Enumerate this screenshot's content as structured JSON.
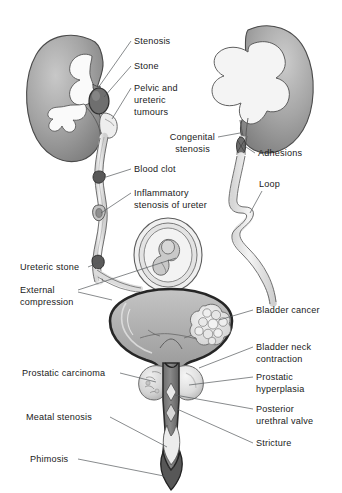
{
  "figure": {
    "background_color": "#ffffff",
    "ink_color": "#1a1a1a",
    "leader_color": "#55595c"
  },
  "palette": {
    "kidney_cortex_dark": "#8d8d8d",
    "kidney_cortex_mid": "#a9a9a9",
    "kidney_cortex_light": "#cfcfcf",
    "calyx_fill": "#fafafa",
    "pelvis_fill": "#f2f2f2",
    "ureter_fill": "#ededed",
    "bladder_fill": "#b0b0b0",
    "bladder_outline": "#262626",
    "stone_fill": "#6f6f6f",
    "tumour_fill": "#e8e8e8",
    "prostate_fill": "#dcdcdc",
    "urethra_dark": "#5a5a5a",
    "fetus_fill": "#d8d8d8",
    "outline": "#4a4a4a"
  },
  "labels": [
    {
      "id": "stenosis",
      "name": "label-stenosis",
      "text": "Stenosis",
      "x": 134,
      "y": 44,
      "anchor": "start"
    },
    {
      "id": "stone",
      "name": "label-stone",
      "text": "Stone",
      "x": 134,
      "y": 69,
      "anchor": "start"
    },
    {
      "id": "pelvic-ureteric-tumours-1",
      "name": "label-pelvic-ureteric-tumours-line1",
      "text": "Pelvic and",
      "x": 134,
      "y": 91,
      "anchor": "start"
    },
    {
      "id": "pelvic-ureteric-tumours-2",
      "name": "label-pelvic-ureteric-tumours-line2",
      "text": "ureteric",
      "x": 134,
      "y": 103,
      "anchor": "start"
    },
    {
      "id": "pelvic-ureteric-tumours-3",
      "name": "label-pelvic-ureteric-tumours-line3",
      "text": "tumours",
      "x": 134,
      "y": 115,
      "anchor": "start"
    },
    {
      "id": "congenital-stenosis-1",
      "name": "label-congenital-stenosis-line1",
      "text": "Congenital",
      "x": 215,
      "y": 140,
      "anchor": "end"
    },
    {
      "id": "congenital-stenosis-2",
      "name": "label-congenital-stenosis-line2",
      "text": "stenosis",
      "x": 210,
      "y": 152,
      "anchor": "end"
    },
    {
      "id": "adhesions",
      "name": "label-adhesions",
      "text": "Adhesions",
      "x": 258,
      "y": 156,
      "anchor": "start"
    },
    {
      "id": "blood-clot",
      "name": "label-blood-clot",
      "text": "Blood clot",
      "x": 134,
      "y": 172,
      "anchor": "start"
    },
    {
      "id": "loop",
      "name": "label-loop",
      "text": "Loop",
      "x": 259,
      "y": 187,
      "anchor": "start"
    },
    {
      "id": "inflammatory-stenosis-1",
      "name": "label-inflammatory-stenosis-line1",
      "text": "Inflammatory",
      "x": 134,
      "y": 196,
      "anchor": "start"
    },
    {
      "id": "inflammatory-stenosis-2",
      "name": "label-inflammatory-stenosis-line2",
      "text": "stenosis of ureter",
      "x": 134,
      "y": 208,
      "anchor": "start"
    },
    {
      "id": "ureteric-stone",
      "name": "label-ureteric-stone",
      "text": "Ureteric stone",
      "x": 20,
      "y": 270,
      "anchor": "start"
    },
    {
      "id": "external-compression-1",
      "name": "label-external-compression-line1",
      "text": "External",
      "x": 20,
      "y": 293,
      "anchor": "start"
    },
    {
      "id": "external-compression-2",
      "name": "label-external-compression-line2",
      "text": "compression",
      "x": 20,
      "y": 305,
      "anchor": "start"
    },
    {
      "id": "bladder-cancer",
      "name": "label-bladder-cancer",
      "text": "Bladder cancer",
      "x": 256,
      "y": 313,
      "anchor": "start"
    },
    {
      "id": "bladder-neck-1",
      "name": "label-bladder-neck-contraction-line1",
      "text": "Bladder neck",
      "x": 256,
      "y": 350,
      "anchor": "start"
    },
    {
      "id": "bladder-neck-2",
      "name": "label-bladder-neck-contraction-line2",
      "text": "contraction",
      "x": 256,
      "y": 362,
      "anchor": "start"
    },
    {
      "id": "prostatic-carcinoma",
      "name": "label-prostatic-carcinoma",
      "text": "Prostatic carcinoma",
      "x": 22,
      "y": 376,
      "anchor": "start"
    },
    {
      "id": "prostatic-hyperplasia-1",
      "name": "label-prostatic-hyperplasia-line1",
      "text": "Prostatic",
      "x": 256,
      "y": 380,
      "anchor": "start"
    },
    {
      "id": "prostatic-hyperplasia-2",
      "name": "label-prostatic-hyperplasia-line2",
      "text": "hyperplasia",
      "x": 256,
      "y": 392,
      "anchor": "start"
    },
    {
      "id": "posterior-urethral-valve-1",
      "name": "label-posterior-urethral-valve-line1",
      "text": "Posterior",
      "x": 256,
      "y": 412,
      "anchor": "start"
    },
    {
      "id": "posterior-urethral-valve-2",
      "name": "label-posterior-urethral-valve-line2",
      "text": "urethral valve",
      "x": 256,
      "y": 424,
      "anchor": "start"
    },
    {
      "id": "meatal-stenosis",
      "name": "label-meatal-stenosis",
      "text": "Meatal stenosis",
      "x": 26,
      "y": 420,
      "anchor": "start"
    },
    {
      "id": "stricture",
      "name": "label-stricture",
      "text": "Stricture",
      "x": 256,
      "y": 446,
      "anchor": "start"
    },
    {
      "id": "phimosis",
      "name": "label-phimosis",
      "text": "Phimosis",
      "x": 30,
      "y": 462,
      "anchor": "start"
    }
  ],
  "leaders": [
    {
      "name": "leader-stenosis",
      "d": "M131,41 L98,88"
    },
    {
      "name": "leader-stone",
      "d": "M131,66 L104,97"
    },
    {
      "name": "leader-pelvic-tumours",
      "d": "M131,88 L112,119"
    },
    {
      "name": "leader-congenital-stenosis",
      "d": "M218,137 L240,133"
    },
    {
      "name": "leader-adhesions",
      "d": "M255,153 L243,145"
    },
    {
      "name": "leader-blood-clot",
      "d": "M131,169 L106,177"
    },
    {
      "name": "leader-loop",
      "d": "M262,191 L250,213"
    },
    {
      "name": "leader-inflammatory-stenosis",
      "d": "M131,193 L101,213"
    },
    {
      "name": "leader-ureteric-stone",
      "d": "M88,267 L100,262"
    },
    {
      "name": "leader-external-compression-a",
      "d": "M78,290 L176,258"
    },
    {
      "name": "leader-external-compression-b",
      "d": "M78,292 L112,300"
    },
    {
      "name": "leader-bladder-cancer",
      "d": "M253,310 L219,320"
    },
    {
      "name": "leader-bladder-neck",
      "d": "M253,347 L199,368"
    },
    {
      "name": "leader-prostatic-carcinoma",
      "d": "M120,373 L156,382"
    },
    {
      "name": "leader-prostatic-hyperplasia",
      "d": "M253,377 L189,385"
    },
    {
      "name": "leader-posterior-urethral-valve",
      "d": "M253,409 L175,395"
    },
    {
      "name": "leader-meatal-stenosis",
      "d": "M110,417 L167,447"
    },
    {
      "name": "leader-stricture",
      "d": "M253,443 L177,409"
    },
    {
      "name": "leader-phimosis",
      "d": "M78,459 L169,477"
    }
  ],
  "structures": [
    {
      "name": "left-kidney",
      "description": "Left kidney with dilated calyces"
    },
    {
      "name": "right-kidney",
      "description": "Right kidney with hydronephrosis"
    },
    {
      "name": "left-ureter",
      "description": "Left ureter"
    },
    {
      "name": "right-ureter",
      "description": "Right ureter with loop"
    },
    {
      "name": "gravid-uterus",
      "description": "Gravid uterus causing external compression"
    },
    {
      "name": "bladder",
      "description": "Urinary bladder"
    },
    {
      "name": "bladder-tumour",
      "description": "Bladder cancer mass"
    },
    {
      "name": "prostate-left-lobe",
      "description": "Prostatic carcinoma lobe"
    },
    {
      "name": "prostate-right-lobe",
      "description": "Prostatic hyperplasia lobe"
    },
    {
      "name": "urethra",
      "description": "Urethra and penis"
    },
    {
      "name": "kidney-stone",
      "description": "Stone in renal pelvis"
    },
    {
      "name": "blood-clot-mass",
      "description": "Blood clot in ureter"
    },
    {
      "name": "ureteric-stone-mass",
      "description": "Stone in distal ureter"
    },
    {
      "name": "adhesion-bands",
      "description": "Adhesion bands on right ureter"
    }
  ]
}
